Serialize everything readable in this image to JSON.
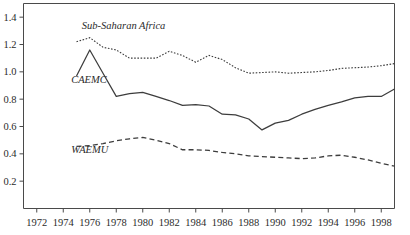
{
  "chart_data": {
    "type": "line",
    "title": "",
    "subtitle": "",
    "xlabel": "",
    "ylabel": "",
    "grid": false,
    "legend_position": "inline-annotation",
    "xlim": [
      1971,
      1999
    ],
    "ylim": [
      0.0,
      1.5
    ],
    "ytick_labels": [
      "0.2",
      "0.4",
      "0.6",
      "0.8",
      "1.0",
      "1.2",
      "1.4"
    ],
    "ytick_values": [
      0.2,
      0.4,
      0.6,
      0.8,
      1.0,
      1.2,
      1.4
    ],
    "xtick_labels": [
      "1972",
      "1974",
      "1976",
      "1978",
      "1980",
      "1982",
      "1984",
      "1986",
      "1988",
      "1990",
      "1992",
      "1994",
      "1996",
      "1998"
    ],
    "xtick_values": [
      1972,
      1974,
      1976,
      1978,
      1980,
      1982,
      1984,
      1986,
      1988,
      1990,
      1992,
      1994,
      1996,
      1998
    ],
    "x": [
      1975,
      1976,
      1977,
      1978,
      1979,
      1980,
      1981,
      1982,
      1983,
      1984,
      1985,
      1986,
      1987,
      1988,
      1989,
      1990,
      1991,
      1992,
      1993,
      1994,
      1995,
      1996,
      1997,
      1998,
      1999
    ],
    "series": [
      {
        "name": "Sub-Saharan Africa",
        "style": "dotted",
        "color": "#3d3d3d",
        "label_x": 1975.4,
        "label_y": 1.31,
        "values": [
          1.22,
          1.25,
          1.18,
          1.16,
          1.1,
          1.1,
          1.1,
          1.15,
          1.12,
          1.07,
          1.12,
          1.09,
          1.03,
          0.99,
          0.995,
          1.0,
          0.99,
          0.995,
          1.0,
          1.01,
          1.025,
          1.03,
          1.035,
          1.045,
          1.06
        ]
      },
      {
        "name": "CAEMC",
        "style": "solid",
        "color": "#3d3d3d",
        "label_x": 1974.6,
        "label_y": 0.915,
        "values": [
          0.97,
          1.16,
          0.99,
          0.82,
          0.84,
          0.85,
          0.82,
          0.79,
          0.755,
          0.76,
          0.75,
          0.69,
          0.685,
          0.655,
          0.575,
          0.625,
          0.645,
          0.69,
          0.725,
          0.755,
          0.78,
          0.81,
          0.82,
          0.82,
          0.875
        ]
      },
      {
        "name": "WAEMU",
        "style": "dashed",
        "color": "#3d3d3d",
        "label_x": 1974.6,
        "label_y": 0.405,
        "values": [
          0.455,
          0.46,
          0.475,
          0.495,
          0.51,
          0.52,
          0.5,
          0.475,
          0.43,
          0.43,
          0.425,
          0.41,
          0.4,
          0.385,
          0.38,
          0.375,
          0.37,
          0.365,
          0.37,
          0.385,
          0.39,
          0.375,
          0.355,
          0.33,
          0.31
        ]
      }
    ],
    "series_extension": {
      "note": "values continue to right frame edge",
      "x_tail": [
        2000,
        2001
      ],
      "caemc_tail": [
        1.0,
        1.1
      ],
      "ssa_tail": [
        1.045,
        1.055
      ],
      "waemu_tail": [
        0.3,
        0.295
      ]
    }
  },
  "axes": {
    "y_axis_name": "value-axis",
    "x_axis_name": "year-axis"
  }
}
